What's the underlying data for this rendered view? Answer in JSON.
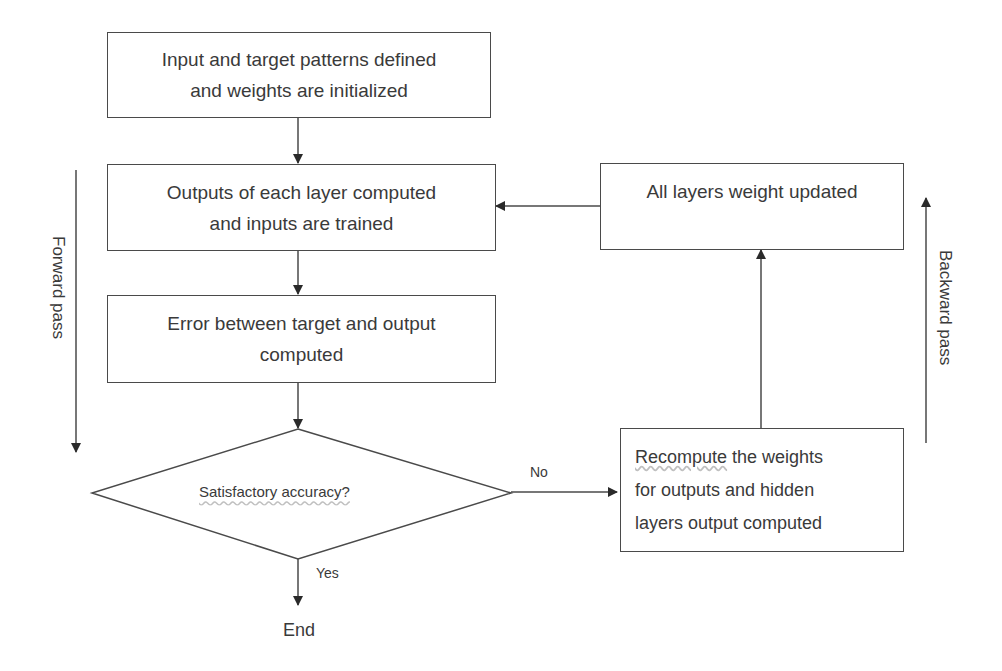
{
  "diagram": {
    "type": "flowchart",
    "nodes": [
      {
        "id": "init",
        "shape": "rect",
        "lines": [
          "Input and target patterns defined",
          "and weights are initialized"
        ]
      },
      {
        "id": "forward",
        "shape": "rect",
        "lines": [
          "Outputs of each layer computed",
          "and inputs are trained"
        ]
      },
      {
        "id": "error",
        "shape": "rect",
        "lines": [
          "Error between target and output",
          "computed"
        ]
      },
      {
        "id": "decision",
        "shape": "diamond",
        "text": "Satisfactory accuracy?"
      },
      {
        "id": "recompute",
        "shape": "rect",
        "lines_parts": [
          [
            "Recompute",
            " the weights"
          ]
        ],
        "lines": [
          "Recompute the weights",
          "for outputs and hidden",
          "layers output computed"
        ]
      },
      {
        "id": "update",
        "shape": "rect",
        "lines": [
          "All layers weight updated"
        ]
      },
      {
        "id": "end",
        "shape": "terminal-text",
        "text": "End"
      }
    ],
    "edges": [
      {
        "from": "init",
        "to": "forward",
        "label": ""
      },
      {
        "from": "forward",
        "to": "error",
        "label": ""
      },
      {
        "from": "error",
        "to": "decision",
        "label": ""
      },
      {
        "from": "decision",
        "to": "recompute",
        "label": "No"
      },
      {
        "from": "decision",
        "to": "end",
        "label": "Yes"
      },
      {
        "from": "recompute",
        "to": "update",
        "label": ""
      },
      {
        "from": "update",
        "to": "forward",
        "label": ""
      }
    ],
    "side_labels": {
      "left": "Forward pass",
      "right": "Backward pass"
    },
    "colors": {
      "line": "#4a4a4a",
      "text": "#3a3a3a",
      "background": "#ffffff"
    }
  },
  "recompute_first_word": "Recompute",
  "recompute_first_rest": " the weights"
}
